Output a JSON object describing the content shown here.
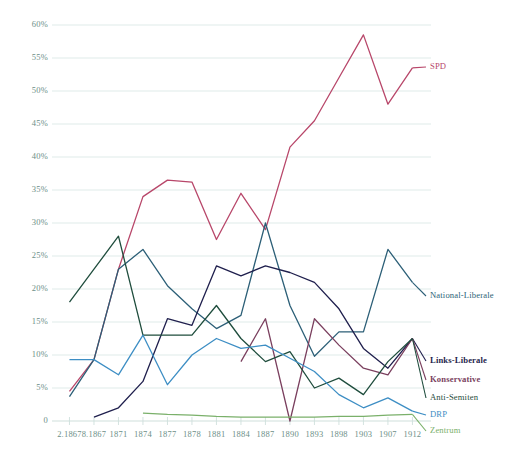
{
  "chart_data": {
    "type": "line",
    "title": "",
    "xlabel": "",
    "ylabel": "",
    "ylim": [
      0,
      62
    ],
    "xlim": [
      0,
      14
    ],
    "grid": true,
    "legend_position": "right",
    "ytick_labels": [
      "60%",
      "55%",
      "50%",
      "45%",
      "40%",
      "35%",
      "30%",
      "25%",
      "20%",
      "15%",
      "10%",
      "5%",
      "0"
    ],
    "ytick_values": [
      60,
      55,
      50,
      45,
      40,
      35,
      30,
      25,
      20,
      15,
      10,
      5,
      0
    ],
    "categories": [
      "2.1867",
      "8.1867",
      "1871",
      "1874",
      "1877",
      "1878",
      "1881",
      "1884",
      "1887",
      "1890",
      "1893",
      "1898",
      "1903",
      "1907",
      "1912"
    ],
    "series": [
      {
        "name": "SPD",
        "color": "#b8476a",
        "label_bold": false,
        "values": [
          4.5,
          9.3,
          23.0,
          34.0,
          36.5,
          36.2,
          27.5,
          34.5,
          29.0,
          41.5,
          45.5,
          52.0,
          58.5,
          48.0,
          53.5
        ]
      },
      {
        "name": "National-Liberale",
        "color": "#2c5f77",
        "label_bold": false,
        "values": [
          3.7,
          9.3,
          23.0,
          26.0,
          20.5,
          17.0,
          14.0,
          16.0,
          30.0,
          17.5,
          9.8,
          13.5,
          13.5,
          26.0,
          21.0
        ]
      },
      {
        "name": "Links-Liberale",
        "color": "#1f1f4d",
        "label_bold": true,
        "values": [
          null,
          0.6,
          2.0,
          6.0,
          15.5,
          14.5,
          23.5,
          22.0,
          23.5,
          22.5,
          21.0,
          17.0,
          11.0,
          8.0,
          12.5
        ]
      },
      {
        "name": "Konservative",
        "color": "#7a3f5e",
        "label_bold": true,
        "values": [
          null,
          null,
          null,
          null,
          null,
          null,
          null,
          9.0,
          15.5,
          0.0,
          15.5,
          11.5,
          8.0,
          7.0,
          12.5
        ]
      },
      {
        "name": "Anti-Semiten",
        "color": "#1f4d3d",
        "label_bold": false,
        "values": [
          18.0,
          23.0,
          28.0,
          13.0,
          13.0,
          13.0,
          17.5,
          12.5,
          9.0,
          10.5,
          5.0,
          6.5,
          4.0,
          9.0,
          12.5
        ]
      },
      {
        "name": "DRP",
        "color": "#3d8ec4",
        "label_bold": false,
        "values": [
          9.3,
          9.3,
          7.0,
          13.0,
          5.5,
          10.0,
          12.5,
          11.0,
          11.5,
          9.5,
          7.5,
          4.0,
          2.0,
          3.5,
          1.5
        ]
      },
      {
        "name": "Zentrum",
        "color": "#7ab06a",
        "label_bold": false,
        "values": [
          null,
          null,
          null,
          1.2,
          1.0,
          0.9,
          0.7,
          0.6,
          0.6,
          0.6,
          0.6,
          0.7,
          0.7,
          0.9,
          1.0
        ]
      }
    ],
    "legend_entries": [
      {
        "name": "SPD",
        "color": "#b8476a",
        "y": 61,
        "bold": false
      },
      {
        "name": "National-Liberale",
        "color": "#2c5f77",
        "y": 290,
        "bold": false
      },
      {
        "name": "Links-Liberale",
        "color": "#1f1f4d",
        "y": 355,
        "bold": true
      },
      {
        "name": "Konservative",
        "color": "#7a3f5e",
        "y": 374,
        "bold": true
      },
      {
        "name": "Anti-Semiten",
        "color": "#1f4d3d",
        "y": 392,
        "bold": false
      },
      {
        "name": "DRP",
        "color": "#3d8ec4",
        "y": 409,
        "bold": false
      },
      {
        "name": "Zentrum",
        "color": "#7ab06a",
        "y": 425,
        "bold": false
      }
    ],
    "axis_color": "#cfe0dc",
    "grid_color": "#dbe9e6",
    "tick_text_color": "#6d8f88"
  }
}
